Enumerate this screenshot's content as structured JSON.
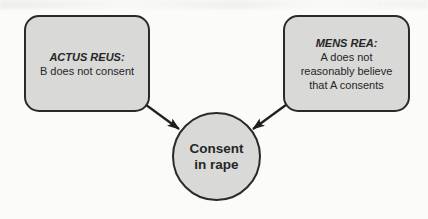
{
  "colors": {
    "background": "#fbfbf9",
    "node_fill": "#d9d9d7",
    "node_border": "#2a2a2a",
    "arrow": "#1f1f1f",
    "text": "#262626"
  },
  "actus_reus_box": {
    "title": "ACTUS REUS:",
    "line1": "B does not consent"
  },
  "mens_rea_box": {
    "title": "MENS REA:",
    "line1": "A does not",
    "line2": "reasonably believe",
    "line3": "that A consents"
  },
  "center_node": {
    "line1": "Consent",
    "line2": "in rape"
  }
}
